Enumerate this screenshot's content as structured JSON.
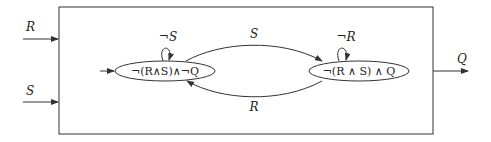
{
  "diagram": {
    "type": "state-machine",
    "inputs": [
      {
        "id": "R",
        "label": "R"
      },
      {
        "id": "S",
        "label": "S"
      }
    ],
    "outputs": [
      {
        "id": "Q",
        "label": "Q"
      }
    ],
    "states": [
      {
        "id": "s0",
        "label": "¬(R∧S)∧¬Q",
        "initial": true,
        "self_loop_label": "¬S"
      },
      {
        "id": "s1",
        "label": "¬(R ∧ S) ∧ Q",
        "initial": false,
        "self_loop_label": "¬R"
      }
    ],
    "transitions": [
      {
        "from": "s0",
        "to": "s1",
        "label": "S"
      },
      {
        "from": "s1",
        "to": "s0",
        "label": "R"
      }
    ],
    "colors": {
      "stroke": "#333333",
      "text": "#222222",
      "background": "#ffffff"
    }
  }
}
